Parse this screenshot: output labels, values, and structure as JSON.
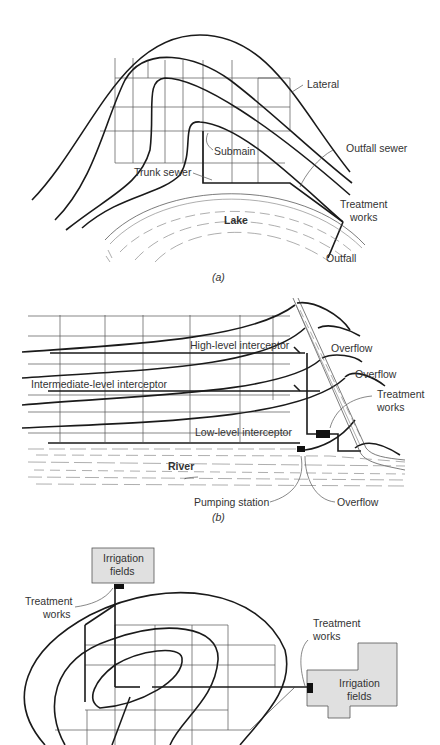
{
  "panels": [
    {
      "id": "a",
      "caption": "(a)",
      "labels": {
        "lateral": "Lateral",
        "submain": "Submain",
        "trunk_sewer": "Trunk sewer",
        "outfall_sewer": "Outfall sewer",
        "treatment_works_1": "Treatment",
        "treatment_works_2": "works",
        "lake": "Lake",
        "outfall": "Outfall"
      }
    },
    {
      "id": "b",
      "caption": "(b)",
      "labels": {
        "high_interceptor": "High-level interceptor",
        "intermediate_interceptor": "Intermediate-level interceptor",
        "low_interceptor": "Low-level interceptor",
        "overflow_1": "Overflow",
        "overflow_2": "Overflow",
        "overflow_3": "Overflow",
        "treatment_works_1": "Treatment",
        "treatment_works_2": "works",
        "river": "River",
        "pumping_station": "Pumping station"
      }
    },
    {
      "id": "c",
      "labels": {
        "irrigation_fields_top_1": "Irrigation",
        "irrigation_fields_top_2": "fields",
        "treatment_works_left_1": "Treatment",
        "treatment_works_left_2": "works",
        "treatment_works_right_1": "Treatment",
        "treatment_works_right_2": "works",
        "irrigation_fields_right_1": "Irrigation",
        "irrigation_fields_right_2": "fields"
      }
    }
  ],
  "colors": {
    "line": "#1a1a1a",
    "grid": "#555555",
    "field_fill": "#e0e0e0",
    "facility": "#111111"
  }
}
